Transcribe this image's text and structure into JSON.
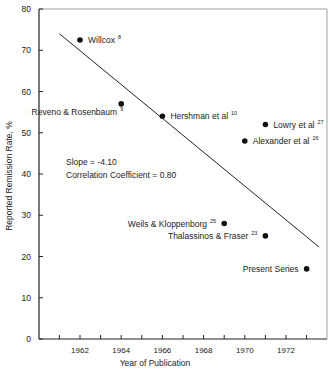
{
  "chart_data": {
    "type": "scatter",
    "title": "",
    "xlabel": "Year of Publication",
    "ylabel": "Reported Remission Rate, %",
    "xlim": [
      1960,
      1974
    ],
    "ylim": [
      0,
      80
    ],
    "x_tick_labels": [
      "1962",
      "1964",
      "1966",
      "1968",
      "1970",
      "1972"
    ],
    "x_minor_ticks": [
      1961,
      1962,
      1963,
      1964,
      1965,
      1966,
      1967,
      1968,
      1969,
      1970,
      1971,
      1972,
      1973
    ],
    "y_ticks": [
      0,
      10,
      20,
      30,
      40,
      50,
      60,
      70,
      80
    ],
    "grid": false,
    "legend": null,
    "points": [
      {
        "label": "Willcox",
        "ref": "8",
        "x": 1962,
        "y": 72.5,
        "label_side": "right"
      },
      {
        "label": "Reveno & Rosenbaum",
        "ref": "9",
        "x": 1964,
        "y": 57,
        "label_side": "below-left"
      },
      {
        "label": "Hershman et al",
        "ref": "10",
        "x": 1966,
        "y": 54,
        "label_side": "right"
      },
      {
        "label": "Lowry et al",
        "ref": "27",
        "x": 1971,
        "y": 52,
        "label_side": "right"
      },
      {
        "label": "Alexander et al",
        "ref": "26",
        "x": 1970,
        "y": 48,
        "label_side": "right"
      },
      {
        "label": "Weils & Kloppenborg",
        "ref": "25",
        "x": 1969,
        "y": 28,
        "label_side": "left"
      },
      {
        "label": "Thalassinos & Fraser",
        "ref": "23",
        "x": 1971,
        "y": 25,
        "label_side": "left"
      },
      {
        "label": "Present Series",
        "ref": "",
        "x": 1973,
        "y": 17,
        "label_side": "left"
      }
    ],
    "regression_line": {
      "x1": 1961,
      "y1": 74,
      "x2": 1973.6,
      "y2": 22.3
    },
    "annotations": [
      "Slope = -4.10",
      "Correlation Coefficient = 0.80"
    ]
  }
}
